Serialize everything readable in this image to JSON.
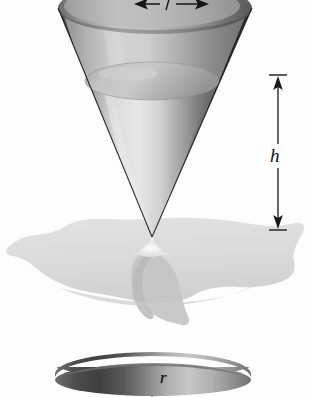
{
  "figure": {
    "title": "Conical funnel draining onto a puddle",
    "background_color": "#fdfdfd",
    "width": 311,
    "height": 397
  },
  "labels": {
    "height_symbol": "h",
    "radius_symbol": "r",
    "radius_symbol_bottom": "r"
  },
  "dimension_h": {
    "name": "height-dimension",
    "symbol": "h",
    "orientation": "vertical",
    "arrow_style": "double-headed-with-end-ticks",
    "x": 278,
    "top_y": 75,
    "bottom_y": 230,
    "color": "#1a1a1a"
  },
  "dimension_r_top": {
    "name": "radius-dimension-top",
    "symbol": "r",
    "orientation": "horizontal",
    "arrow_style": "double-headed",
    "clipped": "top edge of frame",
    "color": "#141414"
  },
  "upper_cone": {
    "name": "upper-cone",
    "apex_x": 152,
    "apex_y": 237,
    "rim_left_x": 58,
    "rim_right_x": 252,
    "rim_center_y": 8,
    "outer_shell_color_dark": "#3a3a3a",
    "outer_shell_color_light": "#c9c9c9",
    "inner_fill_color": "#d9d9d9",
    "liquid_surface_color": "#bdbdbd"
  },
  "liquid_surface": {
    "name": "liquid-surface-ellipse",
    "center_x": 152,
    "center_y": 81,
    "radius_x": 67,
    "radius_y": 19,
    "color": "#bcbcbc"
  },
  "stream": {
    "name": "falling-stream",
    "from_y": 237,
    "to_y": 252,
    "color": "#e8e8e8"
  },
  "puddle": {
    "name": "puddle-blob",
    "top_y": 218,
    "bottom_y": 327,
    "left_x": 6,
    "right_x": 305,
    "fill_color": "#dcdcdc",
    "shadow_color": "#c2c2c2"
  },
  "lower_cone": {
    "name": "lower-cone-partial",
    "rim_left_x": 55,
    "rim_right_x": 251,
    "rim_top_y": 367,
    "fill_color_dark": "#4a4a4a",
    "fill_color_light": "#cfcfcf"
  },
  "colors": {
    "ink": "#1a1a1a",
    "background": "#fdfdfd",
    "cone_dark": "#333333",
    "cone_light": "#d5d5d5",
    "puddle": "#dcdcdc"
  }
}
